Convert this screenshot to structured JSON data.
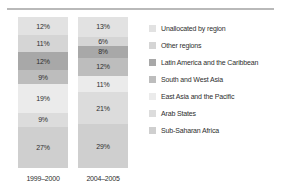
{
  "chart_data": {
    "type": "bar",
    "subtype": "stacked-percentage",
    "title": "",
    "xlabel": "",
    "ylabel": "",
    "ylim": [
      0,
      100
    ],
    "grid": false,
    "legend_position": "right",
    "categories": [
      "1999–2000",
      "2004–2005"
    ],
    "stack_order": "top-to-bottom",
    "series": [
      {
        "name": "Unallocated by region",
        "color": "#e2e2e2",
        "values": [
          12,
          13
        ],
        "labels": [
          "12%",
          "13%"
        ]
      },
      {
        "name": "Other regions",
        "color": "#d5d5d5",
        "values": [
          11,
          6
        ],
        "labels": [
          "11%",
          "6%"
        ]
      },
      {
        "name": "Latin America and the Caribbean",
        "color": "#a8a8a8",
        "values": [
          12,
          8
        ],
        "labels": [
          "12%",
          "8%"
        ]
      },
      {
        "name": "South and West Asia",
        "color": "#bdbdbd",
        "values": [
          9,
          12
        ],
        "labels": [
          "9%",
          "12%"
        ]
      },
      {
        "name": "East Asia and the Pacific",
        "color": "#ebebeb",
        "values": [
          19,
          11
        ],
        "labels": [
          "19%",
          "11%"
        ]
      },
      {
        "name": "Arab States",
        "color": "#dcdcdc",
        "values": [
          9,
          21
        ],
        "labels": [
          "9%",
          "21%"
        ]
      },
      {
        "name": "Sub-Saharan Africa",
        "color": "#cfcfcf",
        "values": [
          27,
          29
        ],
        "labels": [
          "27%",
          "29%"
        ]
      }
    ],
    "bars": [
      {
        "category": "1999–2000",
        "segments": [
          {
            "name": "Unallocated by region",
            "value": 12,
            "label": "12%",
            "color": "#e2e2e2"
          },
          {
            "name": "Other regions",
            "value": 11,
            "label": "11%",
            "color": "#d5d5d5"
          },
          {
            "name": "Latin America and the Caribbean",
            "value": 12,
            "label": "12%",
            "color": "#a8a8a8"
          },
          {
            "name": "South and West Asia",
            "value": 9,
            "label": "9%",
            "color": "#bdbdbd"
          },
          {
            "name": "East Asia and the Pacific",
            "value": 19,
            "label": "19%",
            "color": "#ebebeb"
          },
          {
            "name": "Arab States",
            "value": 9,
            "label": "9%",
            "color": "#dcdcdc"
          },
          {
            "name": "Sub-Saharan Africa",
            "value": 27,
            "label": "27%",
            "color": "#cfcfcf"
          }
        ]
      },
      {
        "category": "2004–2005",
        "segments": [
          {
            "name": "Unallocated by region",
            "value": 13,
            "label": "13%",
            "color": "#e2e2e2"
          },
          {
            "name": "Other regions",
            "value": 6,
            "label": "6%",
            "color": "#d5d5d5"
          },
          {
            "name": "Latin America and the Caribbean",
            "value": 8,
            "label": "8%",
            "color": "#a8a8a8"
          },
          {
            "name": "South and West Asia",
            "value": 12,
            "label": "12%",
            "color": "#bdbdbd"
          },
          {
            "name": "East Asia and the Pacific",
            "value": 11,
            "label": "11%",
            "color": "#ebebeb"
          },
          {
            "name": "Arab States",
            "value": 21,
            "label": "21%",
            "color": "#dcdcdc"
          },
          {
            "name": "Sub-Saharan Africa",
            "value": 29,
            "label": "29%",
            "color": "#cfcfcf"
          }
        ]
      }
    ],
    "legend": [
      {
        "label": "Unallocated by region",
        "color": "#e2e2e2"
      },
      {
        "label": "Other regions",
        "color": "#d5d5d5"
      },
      {
        "label": "Latin America and the Caribbean",
        "color": "#a8a8a8"
      },
      {
        "label": "South and West Asia",
        "color": "#bdbdbd"
      },
      {
        "label": "East Asia and the Pacific",
        "color": "#ebebeb"
      },
      {
        "label": "Arab States",
        "color": "#dcdcdc"
      },
      {
        "label": "Sub-Saharan Africa",
        "color": "#cfcfcf"
      }
    ]
  },
  "axis": {
    "category_labels": [
      "1999–2000",
      "2004–2005"
    ]
  },
  "style": {
    "rule_color": "#b9b9b9",
    "text_color": "#2e2e2e",
    "background": "#ffffff"
  }
}
